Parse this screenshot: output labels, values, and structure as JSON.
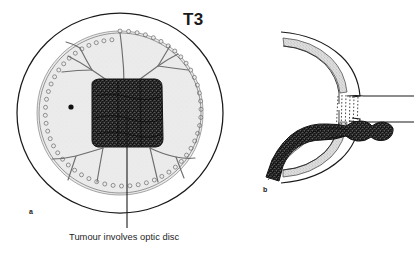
{
  "figure": {
    "stage_label": "T3",
    "caption": "Tumour involves optic disc",
    "panels": [
      {
        "letter": "a",
        "name": "fundus-view"
      },
      {
        "letter": "b",
        "name": "cross-section-view"
      }
    ],
    "colors": {
      "background": "#ffffff",
      "ink": "#1a1a1a",
      "retina_fill": "#ebebeb",
      "vessel": "#6e6e6e",
      "tumour_dark": "#2b2b2b",
      "choroid_band": "#d6d6d6",
      "text": "#1f1f1f"
    },
    "elements": {
      "globe_outline": "sclera-outer-circle",
      "retina_disc": "scalloped-retina-ora-serrata",
      "macula_dot": "macula-fovea-dot",
      "vessels": "retinal-vessel-tree",
      "tumour_mass": "tumour-stippled-mass",
      "leader_line": "caption-leader-line",
      "lamina": "lamina-cribrosa-hatching",
      "optic_nerve": "optic-nerve-sheath",
      "tumour_extension": "tumour-optic-nerve-extension"
    }
  }
}
